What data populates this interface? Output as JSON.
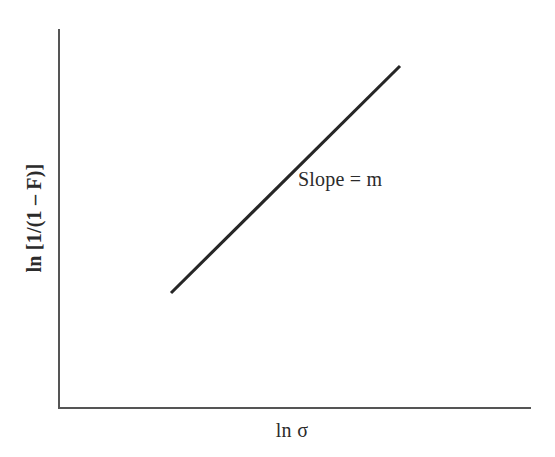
{
  "figure": {
    "background_color": "#ffffff",
    "width": 555,
    "height": 457
  },
  "axes": {
    "y_label": "ln [1/(1 – F)]",
    "x_label": "ln σ",
    "axis_color": "#555555",
    "x_axis": {
      "x_start": 59,
      "x_end": 530,
      "y": 408
    },
    "y_axis": {
      "x": 59,
      "y_start": 30,
      "y_end": 408
    },
    "ticks": [],
    "grid": false
  },
  "annotations": [
    {
      "name": "slope-annotation",
      "text": "Slope = m",
      "x": 298,
      "y": 179
    }
  ],
  "chart_data": {
    "type": "line",
    "title": "",
    "subtitle": "",
    "xlabel": "ln σ",
    "ylabel": "ln [1/(1 – F)]",
    "grid": false,
    "legend": null,
    "axis_ticks_shown": false,
    "series": [
      {
        "name": "Weibull fit line",
        "color": "#262626",
        "line_width": 3,
        "annotation": "Slope = m",
        "points_px": [
          {
            "x": 171,
            "y": 293
          },
          {
            "x": 400,
            "y": 66
          }
        ],
        "x": [
          0.245,
          0.724
        ],
        "values": [
          0.304,
          0.905
        ],
        "description": "Straight line of positive slope m on a log-log Weibull probability plot"
      }
    ],
    "xlim": [
      0,
      1
    ],
    "ylim": [
      0,
      1
    ]
  }
}
